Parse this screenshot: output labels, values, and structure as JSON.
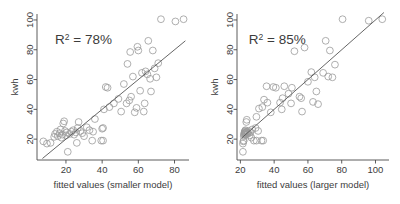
{
  "figure": {
    "title": "",
    "panel_count": 2
  },
  "chart_data": [
    {
      "type": "scatter",
      "title": "",
      "panel": "left",
      "xlabel": "fitted values (smaller model)",
      "ylabel": "kwh",
      "xlim": [
        4,
        88
      ],
      "ylim": [
        6,
        104
      ],
      "xticks": [
        20,
        40,
        60,
        80
      ],
      "yticks": [
        20,
        40,
        60,
        80,
        100
      ],
      "xticklabels": [
        "20",
        "40",
        "60",
        "80"
      ],
      "yticklabels": [
        "20",
        "40",
        "60",
        "80",
        "100"
      ],
      "grid": false,
      "legend": null,
      "annotations": [
        {
          "text": "R2 = 78%",
          "display": "R",
          "sup": "2",
          "rest": "= 78%",
          "x": 14,
          "y": 84
        }
      ],
      "reference_line": {
        "type": "identity",
        "x": [
          7,
          86
        ],
        "y": [
          7,
          86
        ],
        "color": "#555555"
      },
      "marker": {
        "shape": "circle",
        "filled": false,
        "color": "#9a9a9a",
        "size": 3.4
      },
      "points": [
        {
          "x": 7.5,
          "y": 18.5
        },
        {
          "x": 9.5,
          "y": 17.0
        },
        {
          "x": 11.5,
          "y": 17.5
        },
        {
          "x": 13.5,
          "y": 21.5
        },
        {
          "x": 14.0,
          "y": 23.5
        },
        {
          "x": 15.0,
          "y": 25.0
        },
        {
          "x": 15.5,
          "y": 22.0
        },
        {
          "x": 16.5,
          "y": 24.0
        },
        {
          "x": 17.0,
          "y": 26.5
        },
        {
          "x": 17.5,
          "y": 21.0
        },
        {
          "x": 18.0,
          "y": 23.0
        },
        {
          "x": 18.5,
          "y": 30.5
        },
        {
          "x": 19.0,
          "y": 32.0
        },
        {
          "x": 19.5,
          "y": 25.5
        },
        {
          "x": 20.0,
          "y": 22.5
        },
        {
          "x": 20.5,
          "y": 24.5
        },
        {
          "x": 21.0,
          "y": 11.5
        },
        {
          "x": 22.0,
          "y": 23.5
        },
        {
          "x": 23.0,
          "y": 25.0
        },
        {
          "x": 24.0,
          "y": 26.0
        },
        {
          "x": 24.5,
          "y": 23.0
        },
        {
          "x": 25.5,
          "y": 24.5
        },
        {
          "x": 26.0,
          "y": 17.5
        },
        {
          "x": 26.5,
          "y": 27.5
        },
        {
          "x": 27.0,
          "y": 31.5
        },
        {
          "x": 28.0,
          "y": 25.5
        },
        {
          "x": 29.0,
          "y": 24.0
        },
        {
          "x": 30.0,
          "y": 22.0
        },
        {
          "x": 31.5,
          "y": 28.0
        },
        {
          "x": 33.0,
          "y": 26.0
        },
        {
          "x": 34.5,
          "y": 19.0
        },
        {
          "x": 35.0,
          "y": 25.0
        },
        {
          "x": 36.0,
          "y": 33.5
        },
        {
          "x": 39.5,
          "y": 19.0
        },
        {
          "x": 40.5,
          "y": 19.0
        },
        {
          "x": 40.0,
          "y": 27.0
        },
        {
          "x": 40.5,
          "y": 27.5
        },
        {
          "x": 41.0,
          "y": 40.0
        },
        {
          "x": 42.0,
          "y": 55.0
        },
        {
          "x": 43.0,
          "y": 54.5
        },
        {
          "x": 44.0,
          "y": 41.5
        },
        {
          "x": 46.5,
          "y": 44.0
        },
        {
          "x": 49.0,
          "y": 47.0
        },
        {
          "x": 50.5,
          "y": 38.5
        },
        {
          "x": 52.0,
          "y": 57.0
        },
        {
          "x": 53.5,
          "y": 44.0
        },
        {
          "x": 54.0,
          "y": 70.5
        },
        {
          "x": 55.0,
          "y": 46.0
        },
        {
          "x": 55.5,
          "y": 78.5
        },
        {
          "x": 56.0,
          "y": 48.5
        },
        {
          "x": 57.0,
          "y": 62.0
        },
        {
          "x": 58.0,
          "y": 38.0
        },
        {
          "x": 59.0,
          "y": 41.0
        },
        {
          "x": 59.5,
          "y": 82.0
        },
        {
          "x": 60.0,
          "y": 79.5
        },
        {
          "x": 61.0,
          "y": 52.5
        },
        {
          "x": 62.0,
          "y": 64.5
        },
        {
          "x": 63.0,
          "y": 38.5
        },
        {
          "x": 63.5,
          "y": 44.0
        },
        {
          "x": 64.0,
          "y": 65.5
        },
        {
          "x": 65.0,
          "y": 63.5
        },
        {
          "x": 65.5,
          "y": 86.0
        },
        {
          "x": 66.5,
          "y": 60.5
        },
        {
          "x": 67.0,
          "y": 52.0
        },
        {
          "x": 68.0,
          "y": 79.5
        },
        {
          "x": 69.0,
          "y": 67.5
        },
        {
          "x": 70.0,
          "y": 61.5
        },
        {
          "x": 71.0,
          "y": 71.0
        },
        {
          "x": 72.5,
          "y": 100.5
        },
        {
          "x": 80.5,
          "y": 99.0
        },
        {
          "x": 85.0,
          "y": 100.5
        }
      ]
    },
    {
      "type": "scatter",
      "title": "",
      "panel": "right",
      "xlabel": "fitted values (larger model)",
      "ylabel": "kwh",
      "xlim": [
        18,
        108
      ],
      "ylim": [
        6,
        104
      ],
      "xticks": [
        20,
        40,
        60,
        80,
        100
      ],
      "yticks": [
        20,
        40,
        60,
        80,
        100
      ],
      "xticklabels": [
        "20",
        "40",
        "60",
        "80",
        "100"
      ],
      "yticklabels": [
        "20",
        "40",
        "60",
        "80",
        "100"
      ],
      "grid": false,
      "legend": null,
      "annotations": [
        {
          "text": "R2 = 85%",
          "display": "R",
          "sup": "2",
          "rest": "= 85%",
          "x": 25,
          "y": 84
        }
      ],
      "reference_line": {
        "type": "identity",
        "x": [
          21,
          105
        ],
        "y": [
          21,
          105
        ],
        "color": "#555555"
      },
      "marker": {
        "shape": "circle",
        "filled": false,
        "color": "#9a9a9a",
        "size": 3.4
      },
      "points": [
        {
          "x": 21.5,
          "y": 11.5
        },
        {
          "x": 21.5,
          "y": 17.0
        },
        {
          "x": 21.8,
          "y": 18.5
        },
        {
          "x": 22.0,
          "y": 19.0
        },
        {
          "x": 22.0,
          "y": 22.0
        },
        {
          "x": 22.2,
          "y": 23.0
        },
        {
          "x": 22.3,
          "y": 23.5
        },
        {
          "x": 22.5,
          "y": 24.0
        },
        {
          "x": 22.5,
          "y": 24.5
        },
        {
          "x": 22.6,
          "y": 25.0
        },
        {
          "x": 22.8,
          "y": 25.5
        },
        {
          "x": 23.0,
          "y": 24.0
        },
        {
          "x": 23.0,
          "y": 26.0
        },
        {
          "x": 23.2,
          "y": 23.0
        },
        {
          "x": 23.5,
          "y": 24.5
        },
        {
          "x": 23.5,
          "y": 31.5
        },
        {
          "x": 23.8,
          "y": 33.0
        },
        {
          "x": 24.0,
          "y": 25.0
        },
        {
          "x": 24.2,
          "y": 23.5
        },
        {
          "x": 24.5,
          "y": 24.0
        },
        {
          "x": 25.0,
          "y": 25.5
        },
        {
          "x": 25.5,
          "y": 22.5
        },
        {
          "x": 26.0,
          "y": 24.5
        },
        {
          "x": 26.5,
          "y": 21.0
        },
        {
          "x": 27.0,
          "y": 26.5
        },
        {
          "x": 28.0,
          "y": 19.0
        },
        {
          "x": 29.5,
          "y": 19.0
        },
        {
          "x": 29.0,
          "y": 27.5
        },
        {
          "x": 29.5,
          "y": 35.0
        },
        {
          "x": 30.5,
          "y": 25.5
        },
        {
          "x": 31.0,
          "y": 40.5
        },
        {
          "x": 32.5,
          "y": 19.0
        },
        {
          "x": 33.5,
          "y": 19.0
        },
        {
          "x": 33.0,
          "y": 41.5
        },
        {
          "x": 34.0,
          "y": 46.5
        },
        {
          "x": 35.5,
          "y": 55.5
        },
        {
          "x": 36.0,
          "y": 44.5
        },
        {
          "x": 38.0,
          "y": 38.0
        },
        {
          "x": 39.5,
          "y": 55.0
        },
        {
          "x": 41.0,
          "y": 54.5
        },
        {
          "x": 43.5,
          "y": 44.5
        },
        {
          "x": 44.5,
          "y": 40.0
        },
        {
          "x": 45.0,
          "y": 47.5
        },
        {
          "x": 46.0,
          "y": 55.5
        },
        {
          "x": 48.5,
          "y": 50.5
        },
        {
          "x": 50.0,
          "y": 44.0
        },
        {
          "x": 50.5,
          "y": 54.5
        },
        {
          "x": 52.0,
          "y": 79.0
        },
        {
          "x": 55.0,
          "y": 48.5
        },
        {
          "x": 56.0,
          "y": 47.5
        },
        {
          "x": 56.5,
          "y": 38.5
        },
        {
          "x": 58.0,
          "y": 81.5
        },
        {
          "x": 60.0,
          "y": 58.5
        },
        {
          "x": 62.0,
          "y": 65.0
        },
        {
          "x": 63.0,
          "y": 45.0
        },
        {
          "x": 64.0,
          "y": 61.5
        },
        {
          "x": 65.0,
          "y": 52.0
        },
        {
          "x": 66.0,
          "y": 43.5
        },
        {
          "x": 69.0,
          "y": 64.5
        },
        {
          "x": 70.5,
          "y": 86.0
        },
        {
          "x": 72.0,
          "y": 62.0
        },
        {
          "x": 73.0,
          "y": 79.5
        },
        {
          "x": 74.5,
          "y": 61.5
        },
        {
          "x": 76.0,
          "y": 70.0
        },
        {
          "x": 80.5,
          "y": 100.5
        },
        {
          "x": 96.0,
          "y": 99.5
        },
        {
          "x": 104.0,
          "y": 100.5
        }
      ]
    }
  ]
}
